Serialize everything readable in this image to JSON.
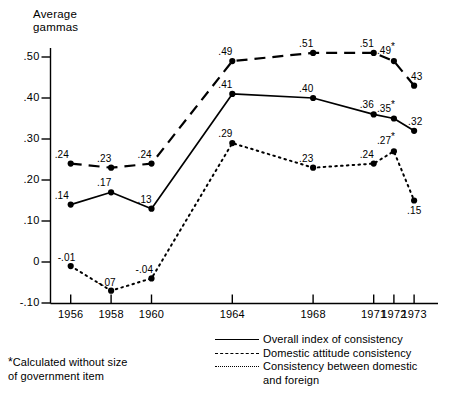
{
  "chart_data": {
    "type": "line",
    "title": "",
    "ylabel": "Average gammas",
    "xlabel": "",
    "categories": [
      "1956",
      "1958",
      "1960",
      "1964",
      "1968",
      "1971",
      "1972",
      "1973"
    ],
    "x": [
      1956,
      1958,
      1960,
      1964,
      1968,
      1971,
      1972,
      1973
    ],
    "ylim": [
      -0.1,
      0.55
    ],
    "xlim": [
      1955,
      1974
    ],
    "yticks": [
      ".50",
      ".40",
      ".30",
      ".20",
      ".10",
      "0",
      "-.10"
    ],
    "ytick_values": [
      0.5,
      0.4,
      0.3,
      0.2,
      0.1,
      0.0,
      -0.1
    ],
    "grid": false,
    "legend_position": "bottom-right",
    "series": [
      {
        "name": "Overall index of consistency",
        "style": "solid",
        "values": [
          0.14,
          0.17,
          0.13,
          0.41,
          0.4,
          0.36,
          0.35,
          0.32
        ],
        "labels": [
          ".14",
          ".17",
          ".13",
          ".41",
          ".40",
          ".36",
          ".35",
          ".32"
        ],
        "starred": [
          false,
          false,
          false,
          false,
          false,
          false,
          true,
          false
        ]
      },
      {
        "name": "Domestic attitude consistency",
        "style": "dashed",
        "values": [
          0.24,
          0.23,
          0.24,
          0.49,
          0.51,
          0.51,
          0.49,
          0.43
        ],
        "labels": [
          ".24",
          ".23",
          ".24",
          ".49",
          ".51",
          ".51",
          ".49",
          ".43"
        ],
        "starred": [
          false,
          false,
          false,
          false,
          false,
          false,
          true,
          false
        ]
      },
      {
        "name": "Consistency between domestic and foreign",
        "style": "dotted",
        "values": [
          -0.01,
          -0.07,
          -0.04,
          0.29,
          0.23,
          0.24,
          0.27,
          0.15
        ],
        "labels": [
          "-.01",
          "-.07",
          "-.04",
          ".29",
          ".23",
          ".24",
          ".27",
          ".15"
        ],
        "starred": [
          false,
          false,
          false,
          false,
          false,
          false,
          true,
          false
        ]
      }
    ],
    "annotations": [
      "*Calculated without size of government item"
    ]
  },
  "axis": {
    "y_title_line1": "Average",
    "y_title_line2": "gammas"
  },
  "legend": {
    "items": [
      {
        "key": "solid",
        "label": "Overall index of consistency",
        "cont": ""
      },
      {
        "key": "dashed",
        "label": "Domestic attitude consistency",
        "cont": ""
      },
      {
        "key": "dotted",
        "label": "Consistency between domestic",
        "cont": "and foreign"
      }
    ]
  },
  "footnote": {
    "star": "*",
    "line1": "Calculated without size",
    "line2": "of government item"
  }
}
